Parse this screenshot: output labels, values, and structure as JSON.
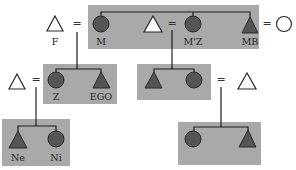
{
  "diagram": {
    "type": "kinship-chart",
    "colors": {
      "box": "#a9a9a9",
      "filled_symbol": "#555555",
      "open_symbol": "#ffffff",
      "line": "#1e1e1e"
    },
    "marriage_symbol": "=",
    "labels": {
      "father": "F",
      "mother": "M",
      "mothers_sister": "M'Z",
      "mothers_brother": "MB",
      "sister": "Z",
      "ego": "EGO",
      "nephew": "Ne",
      "niece": "Ni"
    },
    "legend": {
      "triangle": "male",
      "circle": "female",
      "filled": "member of matrilineage",
      "open": "not member of matrilineage",
      "shaded_box": "sibling group"
    }
  }
}
